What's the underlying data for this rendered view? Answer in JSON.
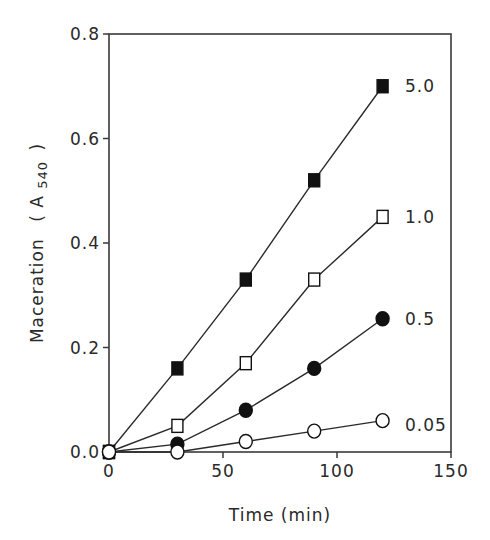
{
  "chart_data": {
    "type": "line",
    "title": "",
    "xlabel": "Time (min)",
    "ylabel": "Maceration (A540)",
    "ylabel_main": "Maceration",
    "ylabel_unit_prefix": "( A",
    "ylabel_unit_sub": "540",
    "ylabel_unit_suffix": ")",
    "xlim": [
      0,
      150
    ],
    "ylim": [
      0,
      0.8
    ],
    "xticks": [
      0,
      50,
      100,
      150
    ],
    "xtick_labels": [
      "0",
      "50",
      "100",
      "150"
    ],
    "yticks": [
      0.0,
      0.2,
      0.4,
      0.6,
      0.8
    ],
    "ytick_labels": [
      "0.0",
      "0.2",
      "0.4",
      "0.6",
      "0.8"
    ],
    "grid": false,
    "legend_position": "inline labels at right end of each series",
    "x": [
      0,
      30,
      60,
      90,
      120
    ],
    "series": [
      {
        "name": "5.0",
        "marker": "filled-square",
        "values": [
          0.0,
          0.16,
          0.33,
          0.52,
          0.7
        ]
      },
      {
        "name": "1.0",
        "marker": "open-square",
        "values": [
          0.0,
          0.05,
          0.17,
          0.33,
          0.45
        ]
      },
      {
        "name": "0.5",
        "marker": "filled-circle",
        "values": [
          0.0,
          0.015,
          0.08,
          0.16,
          0.255
        ]
      },
      {
        "name": "0.05",
        "marker": "open-circle",
        "values": [
          0.0,
          0.0,
          0.02,
          0.04,
          0.06
        ]
      }
    ]
  },
  "colors": {
    "axis": "#3a3a3a",
    "line": "#2a2a2a",
    "background": "#ffffff"
  }
}
